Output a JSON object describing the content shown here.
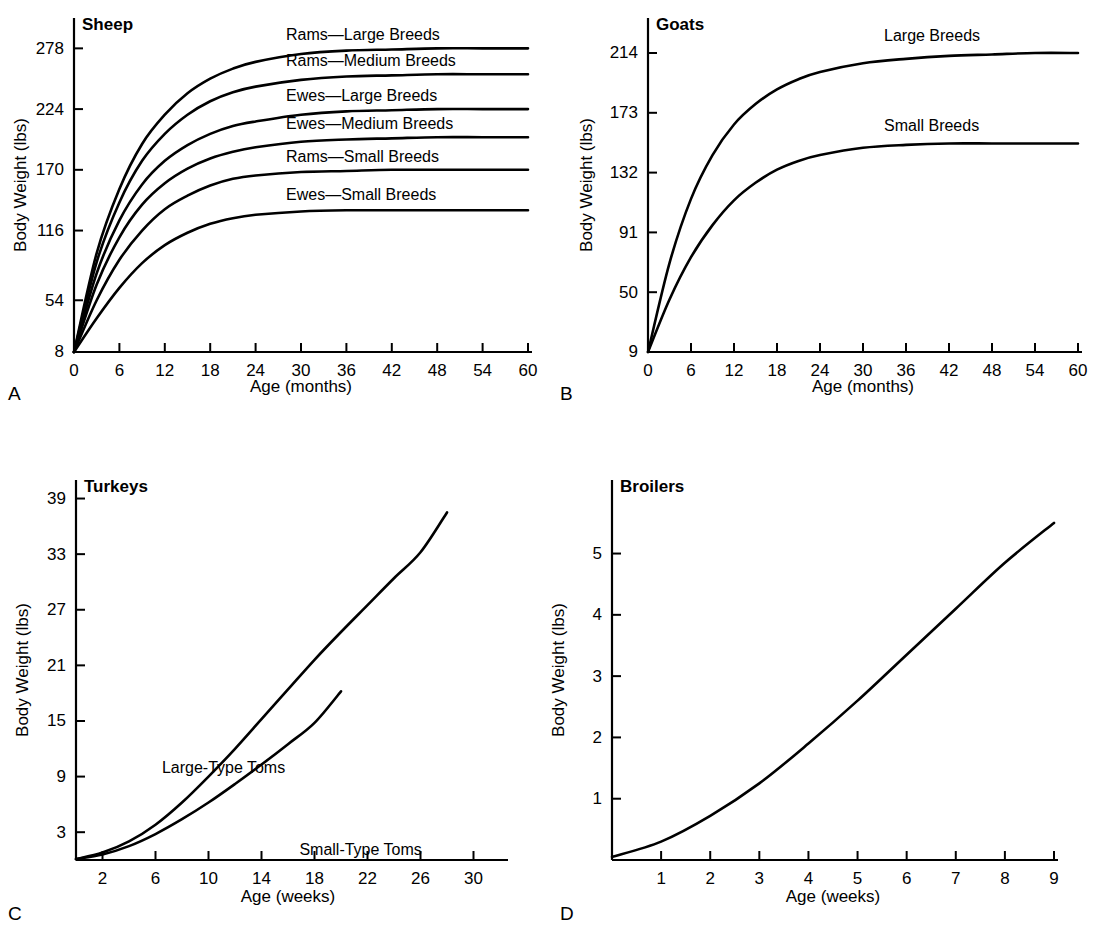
{
  "figure": {
    "background": "#ffffff",
    "ink": "#000000"
  },
  "panels": [
    {
      "letter": "A",
      "title": "Sheep",
      "xlabel": "Age (months)",
      "ylabel": "Body Weight (lbs)"
    },
    {
      "letter": "B",
      "title": "Goats",
      "xlabel": "Age (months)",
      "ylabel": "Body Weight (lbs)"
    },
    {
      "letter": "C",
      "title": "Turkeys",
      "xlabel": "Age (weeks)",
      "ylabel": "Body Weight (lbs)"
    },
    {
      "letter": "D",
      "title": "Broilers",
      "xlabel": "Age (weeks)",
      "ylabel": "Body Weight (lbs)"
    }
  ],
  "chart_data": [
    {
      "id": "sheep",
      "type": "line",
      "title": "Sheep",
      "xlabel": "Age (months)",
      "ylabel": "Body Weight (lbs)",
      "xlim": [
        0,
        60
      ],
      "ylim": [
        8,
        305
      ],
      "xticks": [
        0,
        6,
        12,
        18,
        24,
        30,
        36,
        42,
        48,
        54,
        60
      ],
      "xticklabels": [
        "0",
        "6",
        "12",
        "18",
        "24",
        "30",
        "36",
        "42",
        "48",
        "54",
        "60"
      ],
      "yticks": [
        8,
        54,
        116,
        170,
        224,
        278
      ],
      "yticklabels": [
        "8",
        "54",
        "116",
        "170",
        "224",
        "278"
      ],
      "grid": false,
      "legend": "inline-above-curve",
      "series": [
        {
          "name": "Rams—Large Breeds",
          "plateau": 278,
          "start": 8,
          "x": [
            0,
            3,
            6,
            9,
            12,
            15,
            18,
            21,
            24,
            30,
            36,
            42,
            48,
            54,
            60
          ],
          "values": [
            8,
            96,
            153,
            193,
            219,
            238,
            251,
            260,
            266,
            273,
            276,
            277,
            278,
            278,
            278
          ]
        },
        {
          "name": "Rams—Medium Breeds",
          "plateau": 255,
          "start": 8,
          "x": [
            0,
            3,
            6,
            9,
            12,
            15,
            18,
            21,
            24,
            30,
            36,
            42,
            48,
            54,
            60
          ],
          "values": [
            8,
            88,
            141,
            178,
            202,
            219,
            231,
            239,
            244,
            250,
            253,
            254,
            255,
            255,
            255
          ]
        },
        {
          "name": "Ewes—Large Breeds",
          "plateau": 224,
          "start": 8,
          "x": [
            0,
            3,
            6,
            9,
            12,
            15,
            18,
            21,
            24,
            30,
            36,
            42,
            48,
            54,
            60
          ],
          "values": [
            8,
            78,
            125,
            157,
            178,
            192,
            202,
            209,
            213,
            219,
            222,
            223,
            224,
            224,
            224
          ]
        },
        {
          "name": "Ewes—Medium Breeds",
          "plateau": 199,
          "start": 8,
          "x": [
            0,
            3,
            6,
            9,
            12,
            15,
            18,
            21,
            24,
            30,
            36,
            42,
            48,
            54,
            60
          ],
          "values": [
            8,
            68,
            110,
            139,
            158,
            171,
            180,
            186,
            190,
            195,
            197,
            198,
            199,
            199,
            199
          ]
        },
        {
          "name": "Rams—Small Breeds",
          "plateau": 170,
          "start": 8,
          "x": [
            0,
            3,
            6,
            9,
            12,
            15,
            18,
            21,
            24,
            30,
            36,
            42,
            48,
            54,
            60
          ],
          "values": [
            8,
            54,
            90,
            116,
            135,
            147,
            156,
            162,
            165,
            168,
            169,
            170,
            170,
            170,
            170
          ]
        },
        {
          "name": "Ewes—Small Breeds",
          "plateau": 134,
          "start": 8,
          "x": [
            0,
            3,
            6,
            9,
            12,
            15,
            18,
            21,
            24,
            30,
            36,
            42,
            48,
            54,
            60
          ],
          "values": [
            8,
            38,
            65,
            87,
            103,
            114,
            122,
            127,
            130,
            133,
            134,
            134,
            134,
            134,
            134
          ]
        }
      ]
    },
    {
      "id": "goats",
      "type": "line",
      "title": "Goats",
      "xlabel": "Age (months)",
      "ylabel": "Body Weight (lbs)",
      "xlim": [
        0,
        60
      ],
      "ylim": [
        9,
        238
      ],
      "xticks": [
        0,
        6,
        12,
        18,
        24,
        30,
        36,
        42,
        48,
        54,
        60
      ],
      "xticklabels": [
        "0",
        "6",
        "12",
        "18",
        "24",
        "30",
        "36",
        "42",
        "48",
        "54",
        "60"
      ],
      "yticks": [
        9,
        50,
        91,
        132,
        173,
        214
      ],
      "yticklabels": [
        "9",
        "50",
        "91",
        "132",
        "173",
        "214"
      ],
      "grid": false,
      "legend": "inline-above-curve",
      "series": [
        {
          "name": "Large Breeds",
          "plateau": 214,
          "start": 9,
          "x": [
            0,
            3,
            6,
            9,
            12,
            15,
            18,
            21,
            24,
            30,
            36,
            42,
            48,
            54,
            60
          ],
          "values": [
            9,
            70,
            114,
            144,
            165,
            179,
            189,
            196,
            201,
            207,
            210,
            212,
            213,
            214,
            214
          ]
        },
        {
          "name": "Small Breeds",
          "plateau": 152,
          "start": 9,
          "x": [
            0,
            3,
            6,
            9,
            12,
            15,
            18,
            21,
            24,
            30,
            36,
            42,
            48,
            54,
            60
          ],
          "values": [
            9,
            45,
            74,
            96,
            113,
            125,
            134,
            140,
            144,
            149,
            151,
            152,
            152,
            152,
            152
          ]
        }
      ]
    },
    {
      "id": "turkeys",
      "type": "line",
      "title": "Turkeys",
      "xlabel": "Age (weeks)",
      "ylabel": "Body Weight (lbs)",
      "xlim": [
        0,
        32
      ],
      "ylim": [
        0,
        41
      ],
      "xticks": [
        2,
        6,
        10,
        14,
        18,
        22,
        26,
        30
      ],
      "xticklabels": [
        "2",
        "6",
        "10",
        "14",
        "18",
        "22",
        "26",
        "30"
      ],
      "yticks": [
        3,
        9,
        15,
        21,
        27,
        33,
        39
      ],
      "yticklabels": [
        "3",
        "9",
        "15",
        "21",
        "27",
        "33",
        "39"
      ],
      "grid": false,
      "legend": "inline-beside-curve",
      "series": [
        {
          "name": "Large-Type Toms",
          "x": [
            0,
            2,
            4,
            6,
            8,
            10,
            12,
            14,
            16,
            18,
            20,
            22,
            24,
            26,
            28
          ],
          "values": [
            0.1,
            0.8,
            2.0,
            3.8,
            6.2,
            9.0,
            12.0,
            15.2,
            18.4,
            21.6,
            24.6,
            27.5,
            30.4,
            33.2,
            37.5
          ]
        },
        {
          "name": "Small-Type Toms",
          "x": [
            0,
            2,
            4,
            6,
            8,
            10,
            12,
            14,
            16,
            18,
            20
          ],
          "values": [
            0.1,
            0.6,
            1.5,
            2.8,
            4.4,
            6.2,
            8.2,
            10.3,
            12.5,
            14.8,
            18.2
          ]
        }
      ]
    },
    {
      "id": "broilers",
      "type": "line",
      "title": "Broilers",
      "xlabel": "Age (weeks)",
      "ylabel": "Body Weight (lbs)",
      "xlim": [
        0,
        9
      ],
      "ylim": [
        0,
        6.2
      ],
      "xticks": [
        1,
        2,
        3,
        4,
        5,
        6,
        7,
        8,
        9
      ],
      "xticklabels": [
        "1",
        "2",
        "3",
        "4",
        "5",
        "6",
        "7",
        "8",
        "9"
      ],
      "yticks": [
        1,
        2,
        3,
        4,
        5
      ],
      "yticklabels": [
        "1",
        "2",
        "3",
        "4",
        "5"
      ],
      "grid": false,
      "legend": "none",
      "series": [
        {
          "name": "Broilers",
          "x": [
            0,
            1,
            2,
            3,
            4,
            5,
            6,
            7,
            8,
            9
          ],
          "values": [
            0.05,
            0.3,
            0.72,
            1.25,
            1.9,
            2.6,
            3.35,
            4.1,
            4.85,
            5.5
          ]
        }
      ]
    }
  ]
}
